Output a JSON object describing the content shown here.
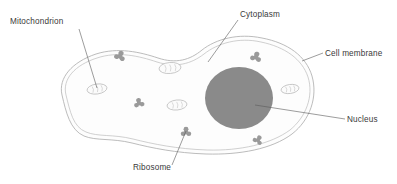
{
  "diagram": {
    "background_color": "#ffffff",
    "width": 397,
    "height": 184,
    "labels": [
      {
        "id": "mitochondrion",
        "text": "Mitochondrion",
        "text_x": 10,
        "text_y": 24,
        "anchor": "start",
        "leader": "M 79 29 L 97 88",
        "points_to": "mitochondrion-organelle"
      },
      {
        "id": "cytoplasm",
        "text": "Cytoplasm",
        "text_x": 240,
        "text_y": 17,
        "anchor": "start",
        "leader": "M 238 20 L 208 62",
        "points_to": "cytoplasm-region"
      },
      {
        "id": "cell-membrane",
        "text": "Cell membrane",
        "text_x": 325,
        "text_y": 56,
        "anchor": "start",
        "leader": "M 323 53 L 302 61",
        "points_to": "cell-membrane-outline"
      },
      {
        "id": "nucleus",
        "text": "Nucleus",
        "text_x": 347,
        "text_y": 122,
        "anchor": "start",
        "leader": "M 345 119 L 255 105",
        "points_to": "nucleus-organelle"
      },
      {
        "id": "ribosome",
        "text": "Ribosome",
        "text_x": 133,
        "text_y": 170,
        "anchor": "start",
        "leader": "M 172 165 L 186 131",
        "points_to": "ribosome-organelle"
      }
    ],
    "colors": {
      "nucleus_fill": "#8a8a8a",
      "ribosome_fill": "#9a9a9a",
      "membrane_stroke": "#b0b0b0",
      "mitochondria_stroke": "#b5b5b5",
      "label_text": "#3a3a3a",
      "leader_stroke": "#5a5a5a",
      "cytoplasm_fill": "#fdfdfd"
    },
    "structures": {
      "cell_membrane": {
        "name": "cell-membrane",
        "description": "double-lined amoeboid outline",
        "outer_path": "M 62 95 C 58 78 72 62 96 54 C 118 47 140 52 158 58 C 176 64 190 60 202 50 C 216 39 238 33 262 38 C 288 43 306 56 312 76 C 318 97 310 120 292 134 C 272 149 240 155 206 154 C 176 153 152 148 132 143 C 112 138 96 141 84 136 C 70 130 66 112 62 95 Z",
        "inner_path": "M 66 95 C 62 79 75 65 97 58 C 118 51 139 56 157 62 C 176 68 191 64 204 54 C 218 43 239 37 261 42 C 285 47 302 59 308 77 C 314 96 306 117 290 130 C 271 144 240 151 207 150 C 177 149 153 144 133 139 C 113 134 98 137 86 132 C 73 127 70 111 66 95 Z"
      },
      "nucleus": {
        "name": "nucleus",
        "cx": 239,
        "cy": 98,
        "rx": 34,
        "ry": 31,
        "fill": "#8a8a8a"
      },
      "mitochondria": [
        {
          "cx": 97,
          "cy": 89,
          "rx": 10,
          "ry": 5,
          "rotate": -8
        },
        {
          "cx": 170,
          "cy": 68,
          "rx": 11,
          "ry": 5.5,
          "rotate": -5
        },
        {
          "cx": 177,
          "cy": 105,
          "rx": 10,
          "ry": 5,
          "rotate": -6
        },
        {
          "cx": 290,
          "cy": 89,
          "rx": 9,
          "ry": 4.5,
          "rotate": -8
        }
      ],
      "ribosomes": [
        {
          "cx": 120,
          "cy": 56,
          "scale": 1.0,
          "rotate": 20
        },
        {
          "cx": 139,
          "cy": 103,
          "scale": 0.95,
          "rotate": -10
        },
        {
          "cx": 256,
          "cy": 57,
          "scale": 1.0,
          "rotate": 15
        },
        {
          "cx": 186,
          "cy": 132,
          "scale": 0.95,
          "rotate": 0
        },
        {
          "cx": 258,
          "cy": 140,
          "scale": 0.9,
          "rotate": 30
        }
      ]
    }
  }
}
